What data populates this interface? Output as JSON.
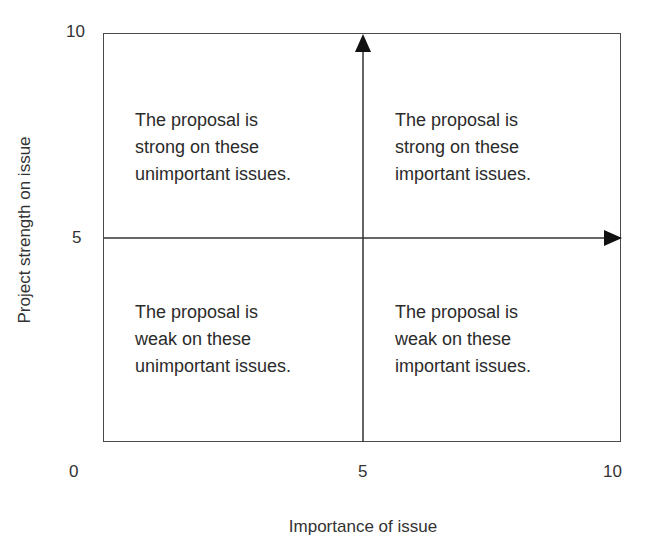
{
  "diagram": {
    "type": "quadrant",
    "x_axis": {
      "label": "Importance of issue",
      "ticks": [
        "0",
        "5",
        "10"
      ]
    },
    "y_axis": {
      "label": "Project strength on issue",
      "ticks": [
        "10",
        "5"
      ]
    },
    "quadrants": {
      "top_left": "The proposal is\nstrong on these\nunimportant issues.",
      "top_right": "The proposal is\nstrong on these\nimportant issues.",
      "bottom_left": "The proposal is\nweak on these\nunimportant issues.",
      "bottom_right": "The proposal is\nweak on these\nimportant issues."
    },
    "colors": {
      "line": "#4a4a4a",
      "arrow": "#1a1a1a",
      "text": "#2b2b2b"
    }
  }
}
